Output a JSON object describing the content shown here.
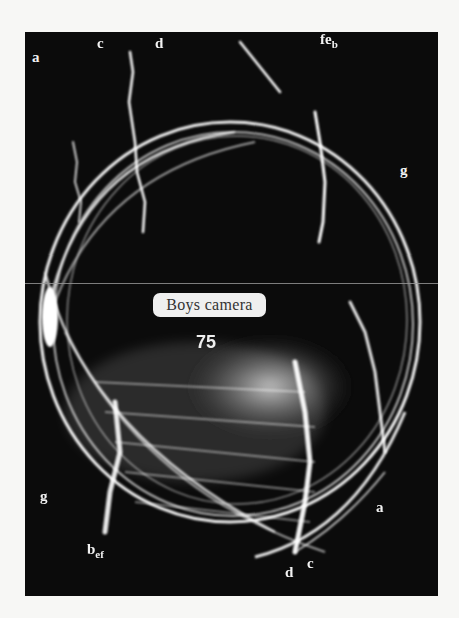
{
  "figure": {
    "label_text": "Boys camera",
    "frame_number": "75",
    "colors": {
      "background": "#0b0b0b",
      "streaks": "#ffffff",
      "page": "#f7f7f5",
      "label_bg": "#efefef"
    },
    "letter_labels": {
      "top_a": "a",
      "top_c": "c",
      "top_d": "d",
      "top_right_f": "f",
      "top_right_e": "e",
      "top_right_b": "b",
      "right_g": "g",
      "left_g": "g",
      "bottom_b": "b",
      "bottom_e": "e",
      "bottom_f": "f",
      "bottom_right_a": "a",
      "bottom_d": "d",
      "bottom_c": "c"
    }
  }
}
